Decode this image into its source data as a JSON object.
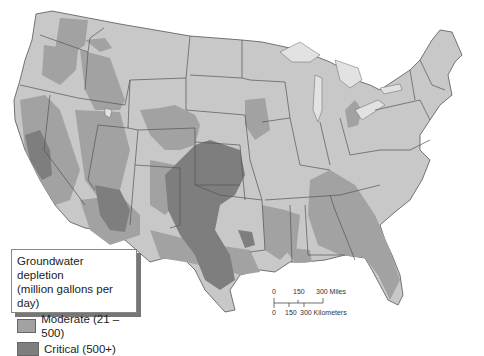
{
  "map": {
    "subject": "Groundwater depletion across the contiguous United States",
    "colors": {
      "background": "#ffffff",
      "no_data_land": "#c8c8c8",
      "moderate": "#a2a2a2",
      "critical": "#7e7e7e",
      "lakes": "#e2e2e2",
      "borders": "#555555"
    }
  },
  "legend": {
    "title_line1": "Groundwater depletion",
    "title_line2": "(million gallons per day)",
    "items": [
      {
        "label": "Moderate (21 – 500)",
        "color": "#a2a2a2"
      },
      {
        "label": "Critical (500+)",
        "color": "#7e7e7e"
      }
    ]
  },
  "scale_bar": {
    "miles": {
      "ticks": [
        "0",
        "150",
        "300 Miles"
      ]
    },
    "kilometers": {
      "ticks": [
        "0",
        "150",
        "300 Kilometers"
      ]
    }
  }
}
